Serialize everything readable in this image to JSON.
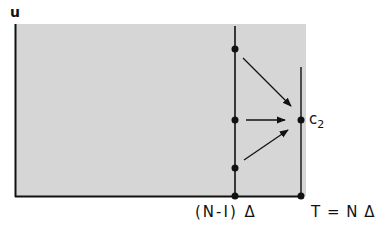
{
  "diagram": {
    "axis_label_y": "u",
    "point_label": "c",
    "point_label_subscript": "2",
    "x_tick_left": "(N-I) Δ",
    "x_tick_right": "T = N Δ",
    "colors": {
      "shade": "#d6d6d6",
      "line": "#111111",
      "background": "#ffffff"
    },
    "nodes": [
      {
        "name": "grid-node-top",
        "x": 235,
        "y": 49
      },
      {
        "name": "grid-node-middle",
        "x": 235,
        "y": 120
      },
      {
        "name": "grid-node-bottom",
        "x": 235,
        "y": 168
      },
      {
        "name": "grid-node-axis-left",
        "x": 235,
        "y": 196
      },
      {
        "name": "target-node-c2",
        "x": 301,
        "y": 120
      },
      {
        "name": "grid-node-axis-right",
        "x": 301,
        "y": 196
      }
    ],
    "arrows": [
      {
        "from": [
          243,
          58
        ],
        "to": [
          291,
          106
        ]
      },
      {
        "from": [
          246,
          120
        ],
        "to": [
          285,
          120
        ]
      },
      {
        "from": [
          244,
          160
        ],
        "to": [
          288,
          130
        ]
      }
    ]
  }
}
